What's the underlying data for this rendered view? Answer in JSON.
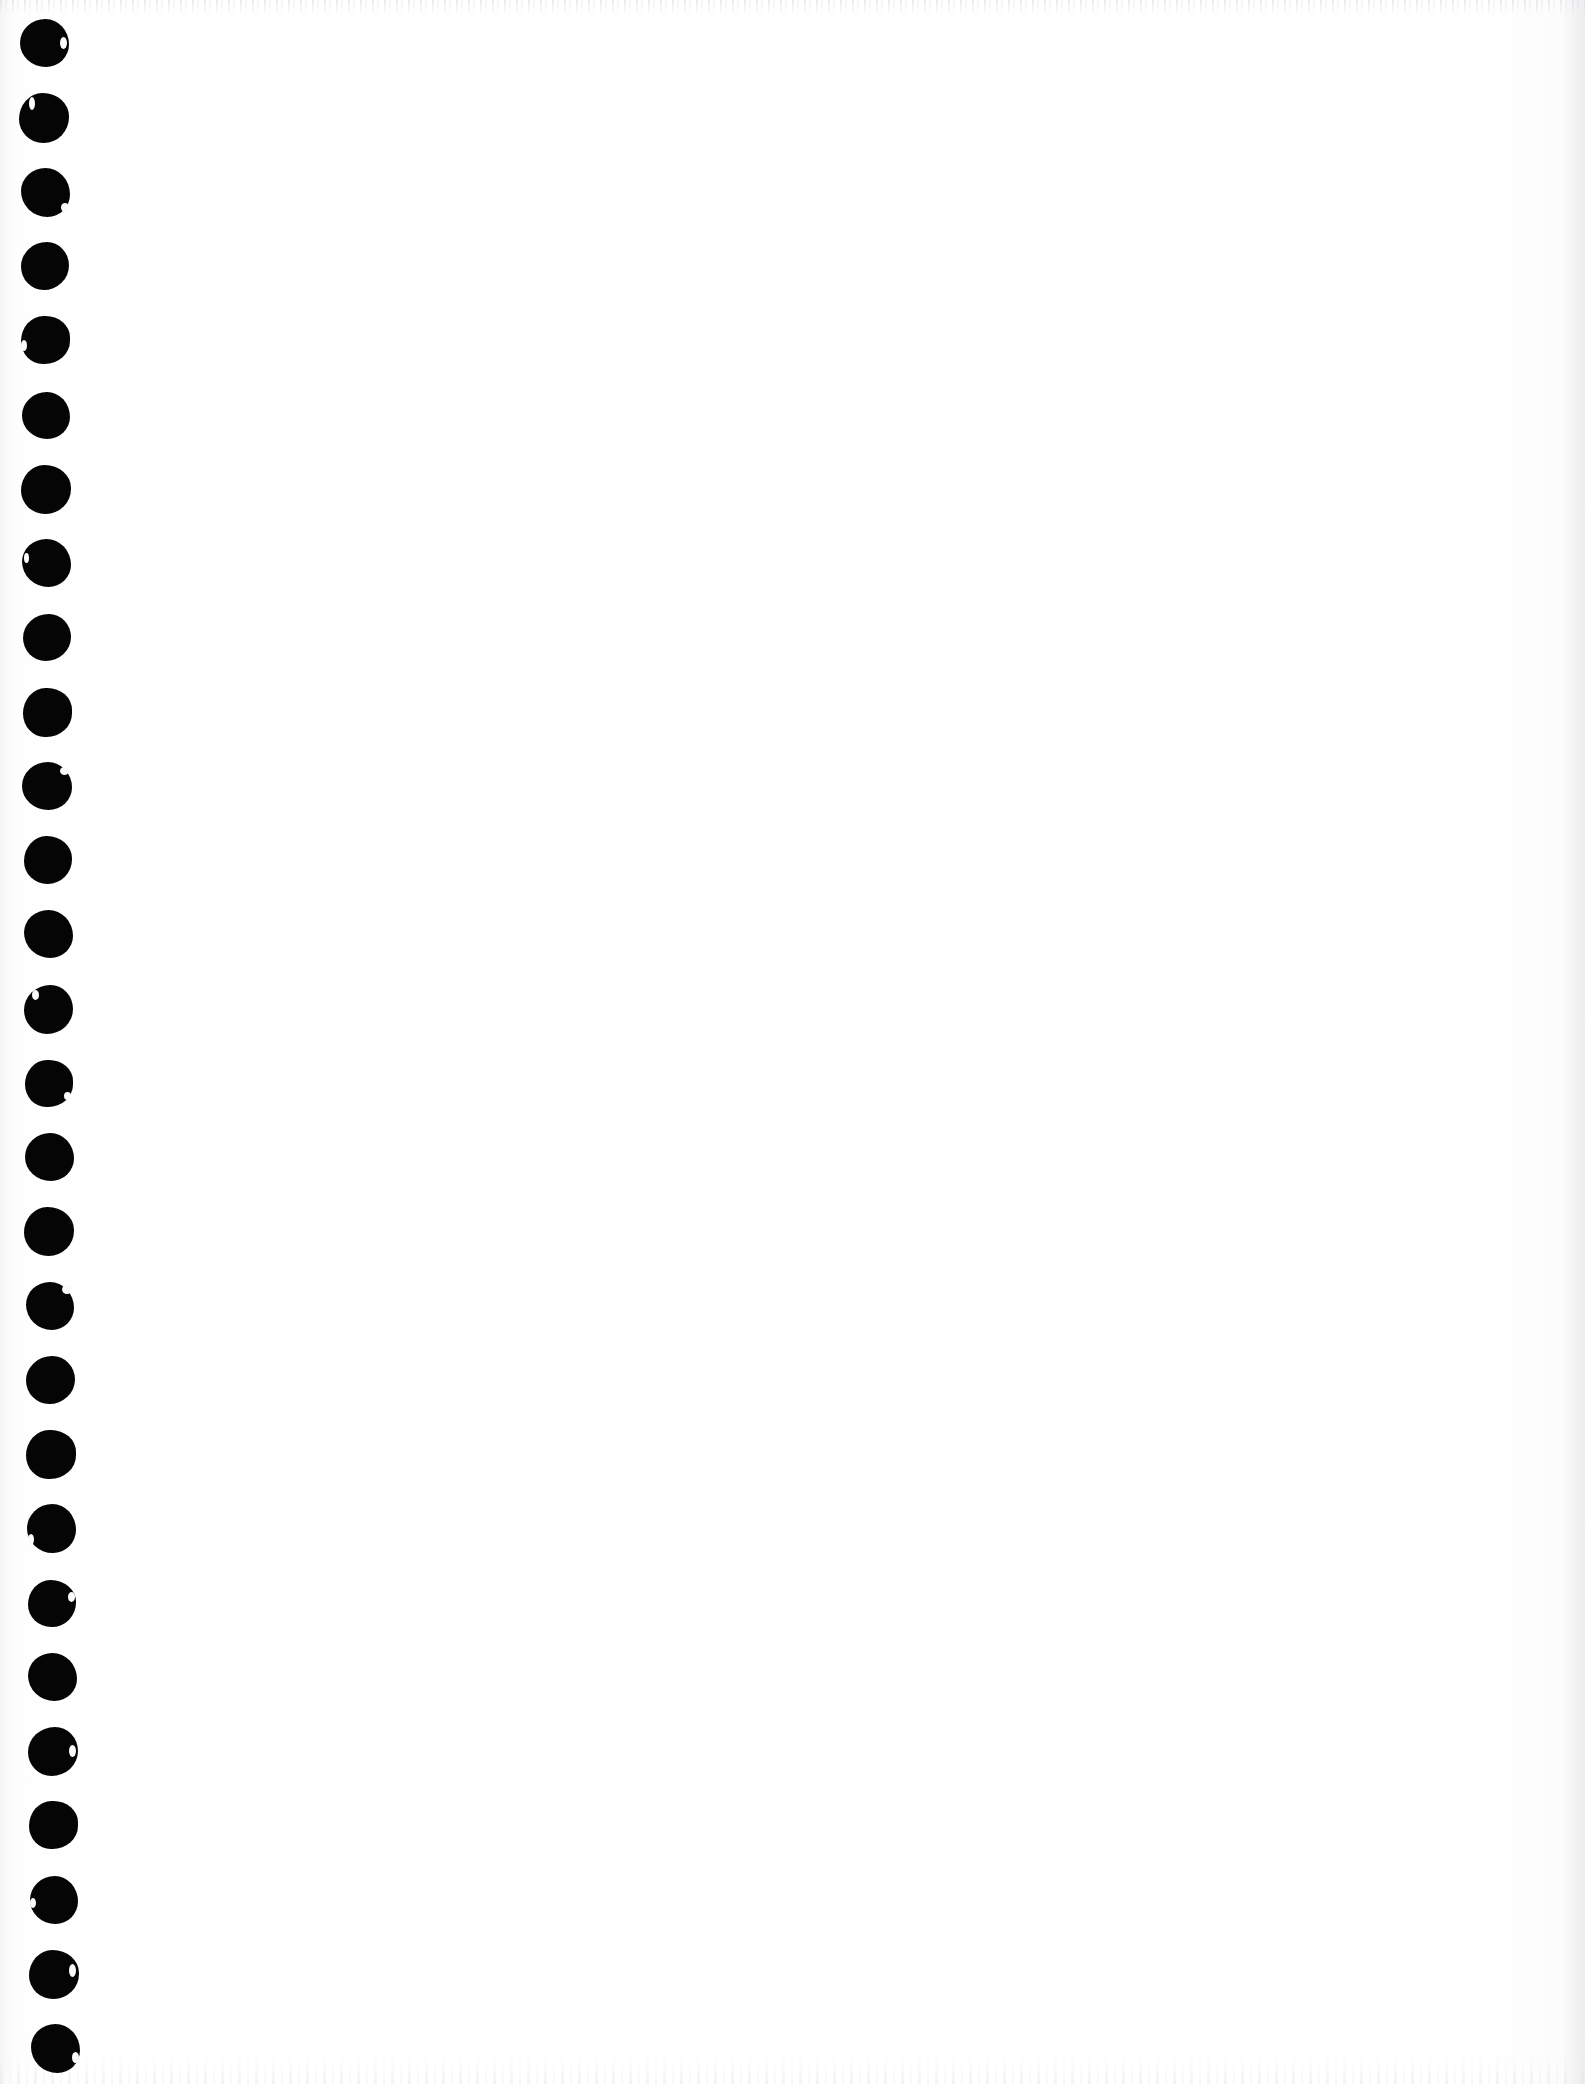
{
  "document": {
    "kind": "scanned-page",
    "page_content": "",
    "visible_text": "",
    "background_color": "#ffffff",
    "ink_color": "#050505",
    "page_width": 1585,
    "page_height": 2084
  },
  "margin": {
    "name": "punched-hole-margin",
    "hole_count": 28,
    "hole_color": "#050505",
    "column_width": 110,
    "first_hole_center_y": 43,
    "hole_spacing_y": 74.5,
    "first_hole_center_x": 44,
    "last_hole_center_x": 55,
    "holes": [
      {
        "cx": 44,
        "cy": 43,
        "w": 49,
        "h": 48,
        "shape": "v1",
        "nick": {
          "x": 40,
          "y": 18,
          "w": 7,
          "h": 12
        }
      },
      {
        "cx": 44,
        "cy": 118,
        "w": 50,
        "h": 50,
        "shape": "v2",
        "nick": {
          "x": 10,
          "y": 4,
          "w": 6,
          "h": 13
        }
      },
      {
        "cx": 45,
        "cy": 192,
        "w": 49,
        "h": 49,
        "shape": "v3",
        "nick": {
          "x": 40,
          "y": 35,
          "w": 8,
          "h": 9
        }
      },
      {
        "cx": 45,
        "cy": 266,
        "w": 48,
        "h": 48,
        "shape": "v4",
        "nick": null
      },
      {
        "cx": 45,
        "cy": 340,
        "w": 49,
        "h": 48,
        "shape": "v5",
        "nick": {
          "x": 0,
          "y": 24,
          "w": 6,
          "h": 11
        }
      },
      {
        "cx": 46,
        "cy": 415,
        "w": 48,
        "h": 47,
        "shape": "v1",
        "nick": null
      },
      {
        "cx": 46,
        "cy": 489,
        "w": 50,
        "h": 49,
        "shape": "v2",
        "nick": null
      },
      {
        "cx": 46,
        "cy": 563,
        "w": 49,
        "h": 48,
        "shape": "v3",
        "nick": {
          "x": 2,
          "y": 14,
          "w": 5,
          "h": 10
        }
      },
      {
        "cx": 47,
        "cy": 637,
        "w": 48,
        "h": 47,
        "shape": "v4",
        "nick": null
      },
      {
        "cx": 47,
        "cy": 712,
        "w": 49,
        "h": 49,
        "shape": "v5",
        "nick": null
      },
      {
        "cx": 47,
        "cy": 786,
        "w": 50,
        "h": 48,
        "shape": "v1",
        "nick": {
          "x": 38,
          "y": 5,
          "w": 9,
          "h": 8
        }
      },
      {
        "cx": 48,
        "cy": 860,
        "w": 48,
        "h": 48,
        "shape": "v2",
        "nick": null
      },
      {
        "cx": 48,
        "cy": 934,
        "w": 49,
        "h": 48,
        "shape": "v3",
        "nick": null
      },
      {
        "cx": 48,
        "cy": 1009,
        "w": 49,
        "h": 49,
        "shape": "v4",
        "nick": {
          "x": 8,
          "y": 5,
          "w": 7,
          "h": 10
        }
      },
      {
        "cx": 49,
        "cy": 1083,
        "w": 48,
        "h": 47,
        "shape": "v5",
        "nick": {
          "x": 39,
          "y": 32,
          "w": 7,
          "h": 8
        }
      },
      {
        "cx": 49,
        "cy": 1157,
        "w": 49,
        "h": 48,
        "shape": "v1",
        "nick": null
      },
      {
        "cx": 49,
        "cy": 1231,
        "w": 50,
        "h": 49,
        "shape": "v2",
        "nick": null
      },
      {
        "cx": 50,
        "cy": 1306,
        "w": 48,
        "h": 48,
        "shape": "v3",
        "nick": {
          "x": 36,
          "y": 3,
          "w": 10,
          "h": 9
        }
      },
      {
        "cx": 50,
        "cy": 1380,
        "w": 49,
        "h": 48,
        "shape": "v4",
        "nick": null
      },
      {
        "cx": 51,
        "cy": 1454,
        "w": 50,
        "h": 49,
        "shape": "v5",
        "nick": null
      },
      {
        "cx": 51,
        "cy": 1528,
        "w": 49,
        "h": 49,
        "shape": "v1",
        "nick": {
          "x": 1,
          "y": 30,
          "w": 6,
          "h": 11
        }
      },
      {
        "cx": 52,
        "cy": 1603,
        "w": 48,
        "h": 47,
        "shape": "v2",
        "nick": {
          "x": 40,
          "y": 12,
          "w": 7,
          "h": 10
        }
      },
      {
        "cx": 52,
        "cy": 1677,
        "w": 49,
        "h": 48,
        "shape": "v3",
        "nick": null
      },
      {
        "cx": 53,
        "cy": 1751,
        "w": 50,
        "h": 49,
        "shape": "v4",
        "nick": {
          "x": 41,
          "y": 18,
          "w": 7,
          "h": 12
        }
      },
      {
        "cx": 53,
        "cy": 1825,
        "w": 49,
        "h": 48,
        "shape": "v5",
        "nick": null
      },
      {
        "cx": 54,
        "cy": 1900,
        "w": 48,
        "h": 48,
        "shape": "v1",
        "nick": {
          "x": 0,
          "y": 22,
          "w": 6,
          "h": 10
        }
      },
      {
        "cx": 54,
        "cy": 1974,
        "w": 50,
        "h": 49,
        "shape": "v2",
        "nick": {
          "x": 40,
          "y": 14,
          "w": 7,
          "h": 13
        }
      },
      {
        "cx": 55,
        "cy": 2048,
        "w": 49,
        "h": 49,
        "shape": "v3",
        "nick": {
          "x": 41,
          "y": 28,
          "w": 7,
          "h": 11
        }
      }
    ]
  }
}
